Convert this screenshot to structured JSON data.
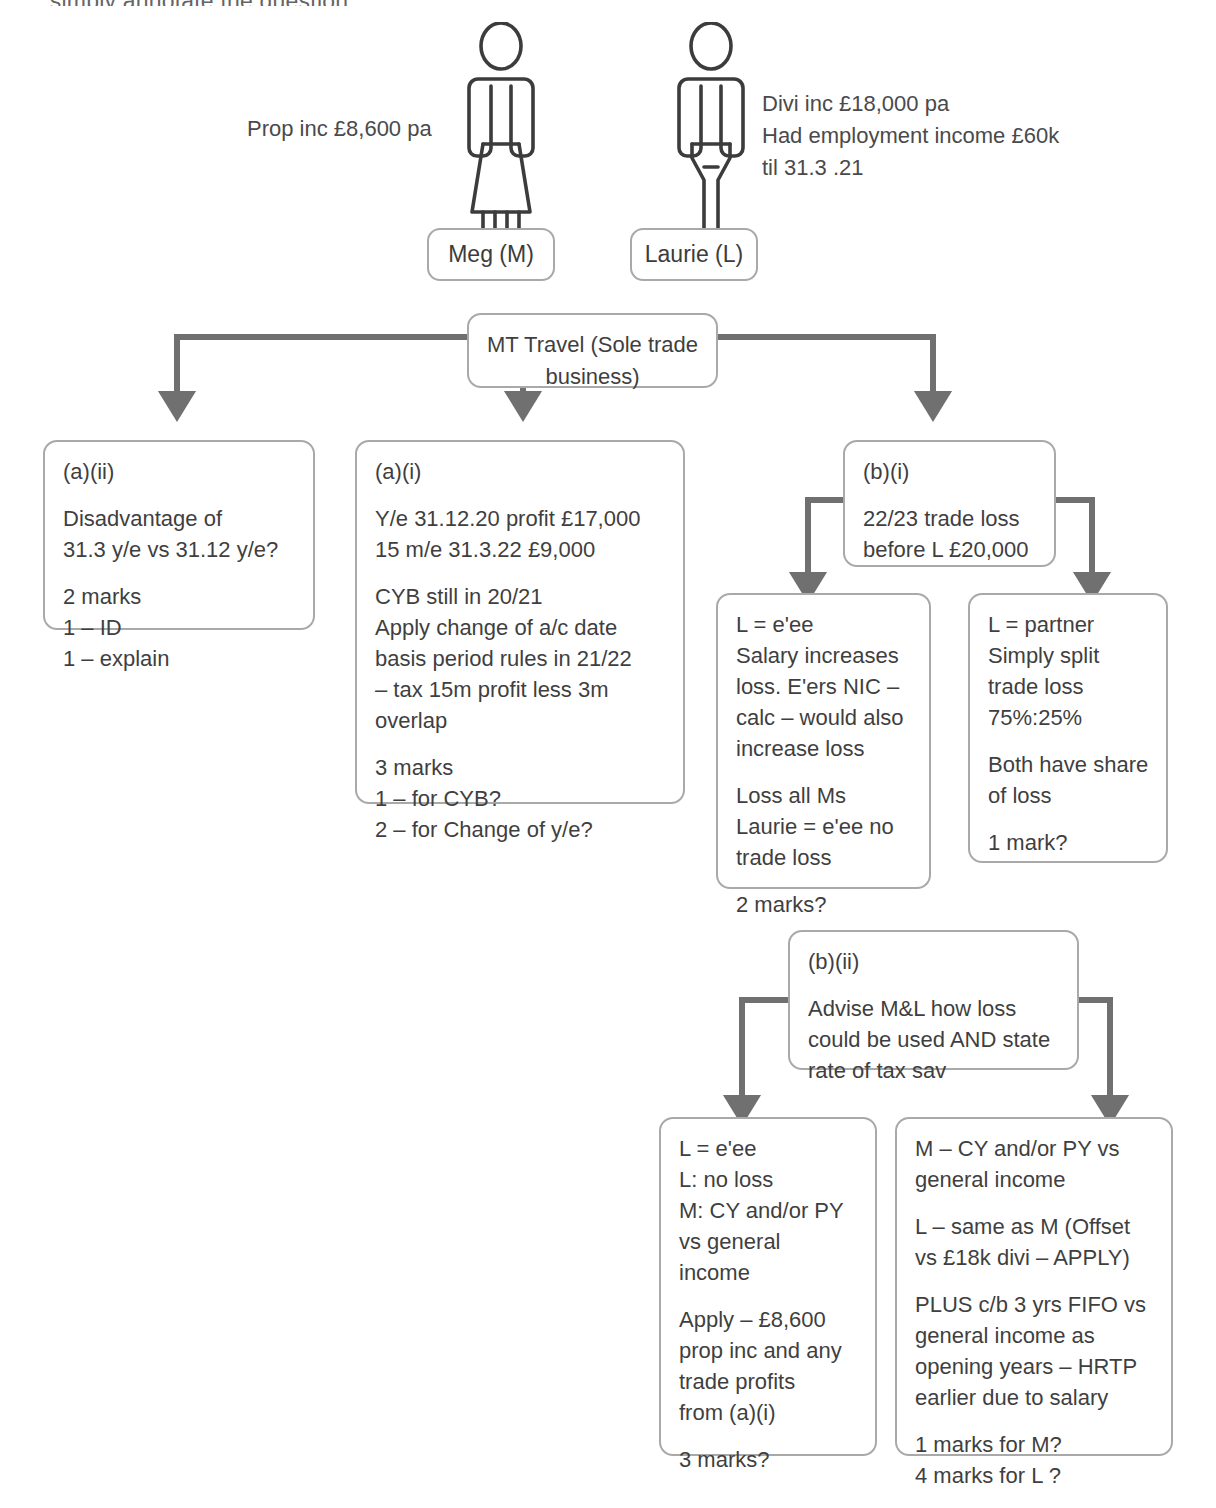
{
  "page": {
    "cut_off_header": "...simply annotate the question."
  },
  "people": [
    {
      "id": "meg",
      "name_label": "Meg (M)",
      "icon": "female-person-icon",
      "annotation": [
        "Prop inc £8,600 pa"
      ]
    },
    {
      "id": "laurie",
      "name_label": "Laurie (L)",
      "icon": "male-person-icon",
      "annotation": [
        "Divi inc £18,000 pa",
        "Had employment income £60k",
        "til 31.3 .21"
      ]
    }
  ],
  "business": {
    "line1": "MT Travel",
    "line2": "(Sole trade business)"
  },
  "nodes": {
    "a_ii": {
      "ref": "(a)(ii)",
      "paras": [
        [
          "Disadvantage of",
          "31.3 y/e vs 31.12 y/e?"
        ],
        [
          "2 marks",
          "1 – ID",
          "1 – explain"
        ]
      ]
    },
    "a_i": {
      "ref": "(a)(i)",
      "paras": [
        [
          "Y/e 31.12.20 profit £17,000",
          "15 m/e 31.3.22 £9,000"
        ],
        [
          "CYB still in 20/21",
          "Apply change of a/c date",
          "basis period rules in 21/22",
          "– tax 15m profit less 3m",
          "overlap"
        ],
        [
          "3 marks",
          "1 – for CYB?",
          "2 – for Change of y/e?"
        ]
      ]
    },
    "b_i": {
      "ref": "(b)(i)",
      "paras": [
        [
          "22/23 trade loss",
          "before L £20,000"
        ]
      ]
    },
    "b_i_left": {
      "ref": "",
      "paras": [
        [
          "L = e'ee",
          "Salary increases",
          "loss. E'ers NIC –",
          "calc – would also",
          "increase loss"
        ],
        [
          "Loss all Ms",
          "Laurie = e'ee no",
          "trade loss"
        ],
        [
          "2 marks?"
        ]
      ]
    },
    "b_i_right": {
      "ref": "",
      "paras": [
        [
          "L = partner",
          "Simply split",
          "trade loss",
          "75%:25%"
        ],
        [
          "Both have share",
          "of loss"
        ],
        [
          "1 mark?"
        ]
      ]
    },
    "b_ii": {
      "ref": "(b)(ii)",
      "paras": [
        [
          "Advise M&L how loss",
          "could be used AND state",
          "rate of tax sav"
        ]
      ]
    },
    "b_ii_left": {
      "ref": "",
      "paras": [
        [
          "L = e'ee",
          "L: no loss",
          "M: CY and/or PY",
          "vs general",
          "income"
        ],
        [
          "Apply – £8,600",
          "prop inc and any",
          "trade profits",
          "from (a)(i)"
        ],
        [
          "3 marks?"
        ]
      ]
    },
    "b_ii_right": {
      "ref": "",
      "paras": [
        [
          "M – CY and/or PY vs",
          "general income"
        ],
        [
          "L – same as M (Offset",
          "vs £18k divi – APPLY)"
        ],
        [
          "PLUS c/b 3 yrs FIFO vs",
          "general income as",
          "opening years – HRTP",
          "earlier due to salary"
        ],
        [
          "1 marks for M?",
          "4 marks for L ?"
        ]
      ]
    }
  },
  "colors": {
    "box_border": "#a9a9a9",
    "arrow": "#707070",
    "text": "#3f3f3f",
    "figure_stroke": "#3c3c3c"
  }
}
